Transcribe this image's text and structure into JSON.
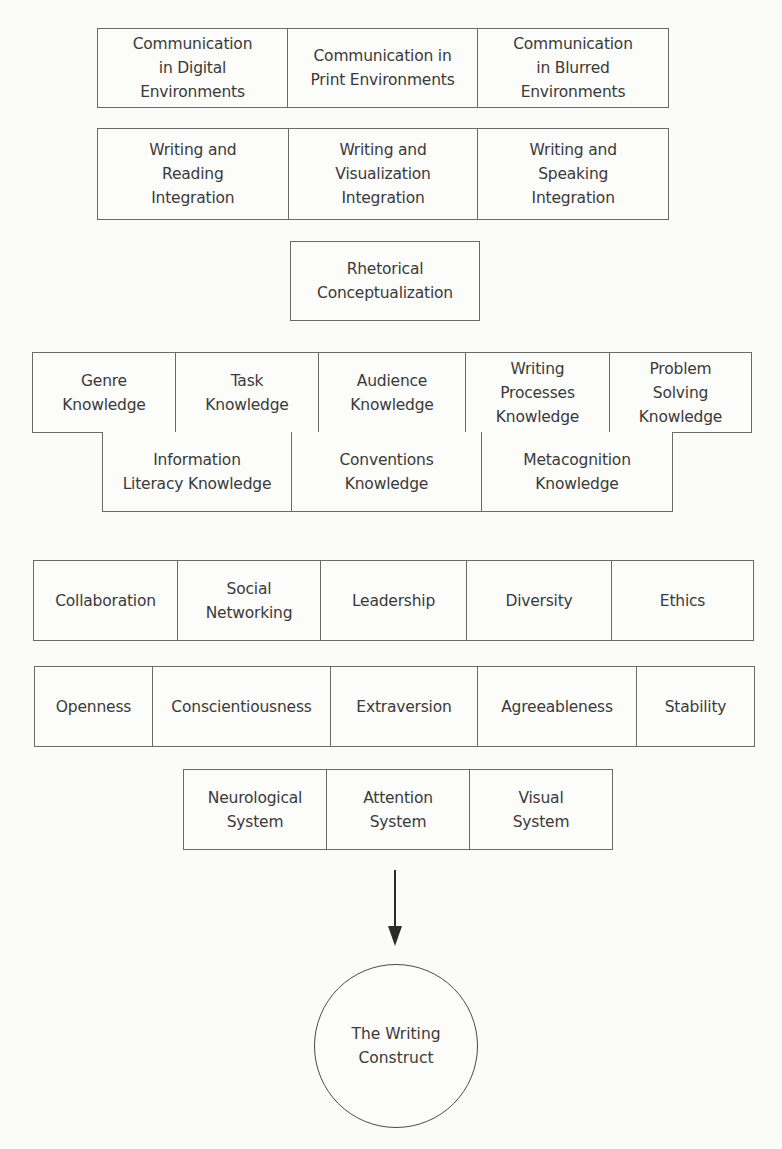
{
  "diagram": {
    "communication_row": {
      "cells": [
        {
          "label": "Communication\nin Digital\nEnvironments"
        },
        {
          "label": "Communication in\nPrint Environments"
        },
        {
          "label": "Communication\nin Blurred\nEnvironments"
        }
      ]
    },
    "integration_row": {
      "cells": [
        {
          "label": "Writing and\nReading\nIntegration"
        },
        {
          "label": "Writing and\nVisualization\nIntegration"
        },
        {
          "label": "Writing and\nSpeaking\nIntegration"
        }
      ]
    },
    "rhetorical_box": {
      "label": "Rhetorical\nConceptualization"
    },
    "knowledge_row_1": {
      "cells": [
        {
          "label": "Genre\nKnowledge"
        },
        {
          "label": "Task\nKnowledge"
        },
        {
          "label": "Audience\nKnowledge"
        },
        {
          "label": "Writing\nProcesses\nKnowledge"
        },
        {
          "label": "Problem\nSolving\nKnowledge"
        }
      ]
    },
    "knowledge_row_2": {
      "cells": [
        {
          "label": "Information\nLiteracy Knowledge"
        },
        {
          "label": "Conventions\nKnowledge"
        },
        {
          "label": "Metacognition\nKnowledge"
        }
      ]
    },
    "social_row": {
      "cells": [
        {
          "label": "Collaboration"
        },
        {
          "label": "Social\nNetworking"
        },
        {
          "label": "Leadership"
        },
        {
          "label": "Diversity"
        },
        {
          "label": "Ethics"
        }
      ]
    },
    "personality_row": {
      "cells": [
        {
          "label": "Openness"
        },
        {
          "label": "Conscientiousness"
        },
        {
          "label": "Extraversion"
        },
        {
          "label": "Agreeableness"
        },
        {
          "label": "Stability"
        }
      ]
    },
    "cognitive_row": {
      "cells": [
        {
          "label": "Neurological\nSystem"
        },
        {
          "label": "Attention\nSystem"
        },
        {
          "label": "Visual\nSystem"
        }
      ]
    },
    "arrow": {
      "direction": "down"
    },
    "result_circle": {
      "label": "The Writing\nConstruct"
    }
  }
}
